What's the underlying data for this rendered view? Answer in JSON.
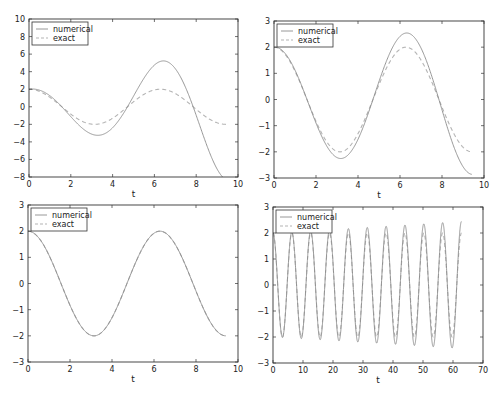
{
  "chart_data": [
    {
      "type": "line",
      "title": "",
      "xlabel": "t",
      "ylabel": "",
      "xlim": [
        0,
        10
      ],
      "ylim": [
        -8,
        10
      ],
      "xticks": [
        "0",
        "2",
        "4",
        "6",
        "8",
        "10"
      ],
      "yticks": [
        "−8",
        "−6",
        "−4",
        "−2",
        "0",
        "2",
        "4",
        "6",
        "8",
        "10"
      ],
      "legend": [
        "numerical",
        "exact"
      ],
      "legend_position": "upper left",
      "grid": false,
      "t_range": [
        0,
        9.42
      ],
      "series": [
        {
          "name": "numerical",
          "style": "solid",
          "model": "2*cos(t)*exp(0.151*t)",
          "x": [
            0,
            1.57,
            3.14,
            4.71,
            6.28,
            7.85,
            9.42
          ],
          "values": [
            2.0,
            -2.6,
            3.3,
            -4.2,
            5.3,
            -7.0,
            8.4
          ]
        },
        {
          "name": "exact",
          "style": "dashed",
          "model": "2*cos(t)",
          "x": [
            0,
            1.57,
            3.14,
            4.71,
            6.28,
            7.85,
            9.42
          ],
          "values": [
            2.0,
            -2.0,
            2.0,
            -2.0,
            2.0,
            -2.0,
            2.0
          ]
        }
      ]
    },
    {
      "type": "line",
      "title": "",
      "xlabel": "t",
      "ylabel": "",
      "xlim": [
        0,
        10
      ],
      "ylim": [
        -3,
        3
      ],
      "xticks": [
        "0",
        "2",
        "4",
        "6",
        "8",
        "10"
      ],
      "yticks": [
        "−3",
        "−2",
        "−1",
        "0",
        "1",
        "2",
        "3"
      ],
      "legend": [
        "numerical",
        "exact"
      ],
      "legend_position": "upper left",
      "grid": false,
      "t_range": [
        0,
        9.42
      ],
      "series": [
        {
          "name": "numerical",
          "style": "solid",
          "model": "2*cos(t)*exp(0.038*t)",
          "x": [
            0,
            1.57,
            3.14,
            4.71,
            6.28,
            7.85,
            9.42
          ],
          "values": [
            2.0,
            -2.12,
            2.25,
            -2.4,
            2.55,
            -2.72,
            2.85
          ]
        },
        {
          "name": "exact",
          "style": "dashed",
          "model": "2*cos(t)",
          "x": [
            0,
            1.57,
            3.14,
            4.71,
            6.28,
            7.85,
            9.42
          ],
          "values": [
            2.0,
            -2.0,
            2.0,
            -2.0,
            2.0,
            -2.0,
            2.0
          ]
        }
      ]
    },
    {
      "type": "line",
      "title": "",
      "xlabel": "t",
      "ylabel": "",
      "xlim": [
        0,
        10
      ],
      "ylim": [
        -3,
        3
      ],
      "xticks": [
        "0",
        "2",
        "4",
        "6",
        "8",
        "10"
      ],
      "yticks": [
        "−3",
        "−2",
        "−1",
        "0",
        "1",
        "2",
        "3"
      ],
      "legend": [
        "numerical",
        "exact"
      ],
      "legend_position": "upper left",
      "grid": false,
      "t_range": [
        0,
        9.42
      ],
      "series": [
        {
          "name": "numerical",
          "style": "solid",
          "model": "2*cos(t)",
          "x": [
            0,
            1.57,
            3.14,
            4.71,
            6.28,
            7.85,
            9.42
          ],
          "values": [
            2.0,
            -2.0,
            2.0,
            -2.0,
            2.0,
            -2.0,
            2.0
          ]
        },
        {
          "name": "exact",
          "style": "dashed",
          "model": "2*cos(t)",
          "x": [
            0,
            1.57,
            3.14,
            4.71,
            6.28,
            7.85,
            9.42
          ],
          "values": [
            2.0,
            -2.0,
            2.0,
            -2.0,
            2.0,
            -2.0,
            2.0
          ]
        }
      ]
    },
    {
      "type": "line",
      "title": "",
      "xlabel": "t",
      "ylabel": "",
      "xlim": [
        0,
        70
      ],
      "ylim": [
        -3,
        3
      ],
      "xticks": [
        "0",
        "10",
        "20",
        "30",
        "40",
        "50",
        "60",
        "70"
      ],
      "yticks": [
        "−3",
        "−2",
        "−1",
        "0",
        "1",
        "2",
        "3"
      ],
      "legend": [
        "numerical",
        "exact"
      ],
      "legend_position": "upper left",
      "grid": false,
      "t_range": [
        0,
        62.83
      ],
      "series": [
        {
          "name": "numerical",
          "style": "solid",
          "model": "2*cos(t)*exp(0.0032*t)",
          "x": [
            0,
            10,
            20,
            30,
            40,
            50,
            60,
            62.8
          ],
          "values_amplitude": [
            2.0,
            2.06,
            2.13,
            2.2,
            2.27,
            2.34,
            2.42,
            2.44
          ]
        },
        {
          "name": "exact",
          "style": "dashed",
          "model": "2*cos(t)",
          "x": [
            0,
            10,
            20,
            30,
            40,
            50,
            60,
            62.8
          ],
          "values_amplitude": [
            2.0,
            2.0,
            2.0,
            2.0,
            2.0,
            2.0,
            2.0,
            2.0
          ]
        }
      ]
    }
  ],
  "panels": [
    {
      "growth": 0.151,
      "xmax": 10,
      "ymin": -8,
      "ymax": 10,
      "tmax": 9.42,
      "xticks": [
        0,
        2,
        4,
        6,
        8,
        10
      ],
      "yticks": [
        -8,
        -6,
        -4,
        -2,
        0,
        2,
        4,
        6,
        8,
        10
      ],
      "box": {
        "left": 29,
        "top": 19,
        "right": 238,
        "bottom": 177
      }
    },
    {
      "growth": 0.038,
      "xmax": 10,
      "ymin": -3,
      "ymax": 3,
      "tmax": 9.42,
      "xticks": [
        0,
        2,
        4,
        6,
        8,
        10
      ],
      "yticks": [
        -3,
        -2,
        -1,
        0,
        1,
        2,
        3
      ],
      "box": {
        "left": 274,
        "top": 21,
        "right": 484,
        "bottom": 178
      }
    },
    {
      "growth": 0.0,
      "xmax": 10,
      "ymin": -3,
      "ymax": 3,
      "tmax": 9.42,
      "xticks": [
        0,
        2,
        4,
        6,
        8,
        10
      ],
      "yticks": [
        -3,
        -2,
        -1,
        0,
        1,
        2,
        3
      ],
      "box": {
        "left": 28,
        "top": 205,
        "right": 238,
        "bottom": 362
      }
    },
    {
      "growth": 0.0032,
      "xmax": 70,
      "ymin": -3,
      "ymax": 3,
      "tmax": 62.83,
      "xticks": [
        0,
        10,
        20,
        30,
        40,
        50,
        60,
        70
      ],
      "yticks": [
        -3,
        -2,
        -1,
        0,
        1,
        2,
        3
      ],
      "box": {
        "left": 273,
        "top": 207,
        "right": 483,
        "bottom": 363
      }
    }
  ],
  "legend": {
    "numerical": "numerical",
    "exact": "exact"
  },
  "axis": {
    "xlabel": "t"
  },
  "colors": {
    "numerical": "#8c8c8c",
    "exact": "#b4b4b4",
    "axes": "#333333"
  }
}
